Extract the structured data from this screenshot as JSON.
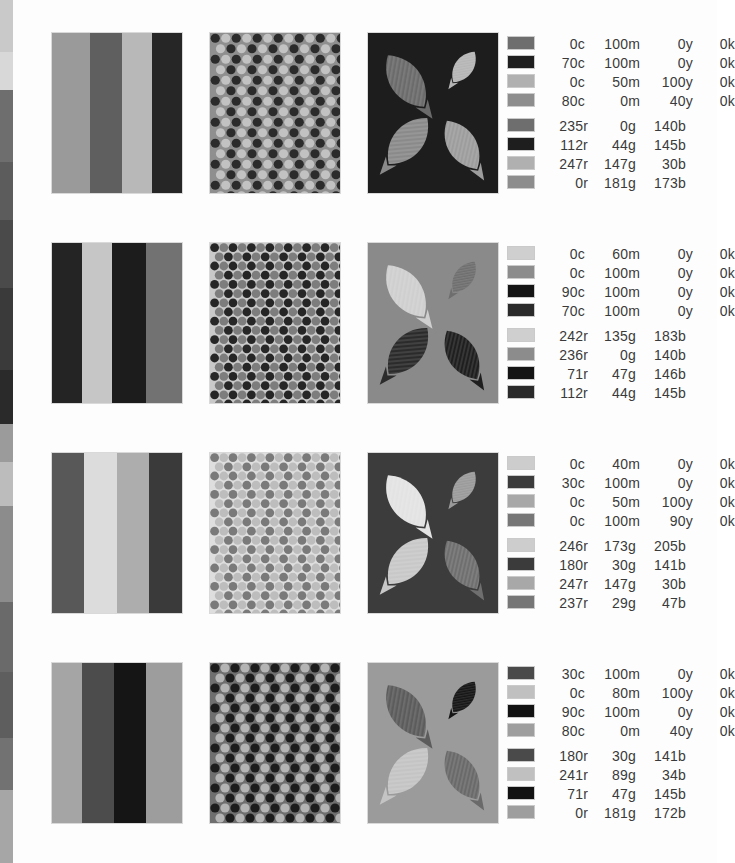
{
  "page": {
    "background": "#fdfdfd",
    "text_color": "#3a3a3a",
    "edge_sliver": {
      "name": "cut-off-adjacent-page",
      "slices": [
        {
          "top": 0,
          "height": 52,
          "color": "#c9c9c9",
          "hatched": true
        },
        {
          "top": 52,
          "height": 38,
          "color": "#d8d8d8",
          "hatched": false
        },
        {
          "top": 90,
          "height": 72,
          "color": "#6e6e6e",
          "hatched": false
        },
        {
          "top": 162,
          "height": 58,
          "color": "#5c5c5c",
          "hatched": true
        },
        {
          "top": 220,
          "height": 68,
          "color": "#4a4a4a",
          "hatched": false
        },
        {
          "top": 288,
          "height": 82,
          "color": "#3a3a3a",
          "hatched": false
        },
        {
          "top": 370,
          "height": 54,
          "color": "#2a2a2a",
          "hatched": false
        },
        {
          "top": 424,
          "height": 38,
          "color": "#9b9b9b",
          "hatched": false
        },
        {
          "top": 462,
          "height": 44,
          "color": "#bcbcbc",
          "hatched": false
        },
        {
          "top": 506,
          "height": 96,
          "color": "#8c8c8c",
          "hatched": true
        },
        {
          "top": 602,
          "height": 70,
          "color": "#6a6a6a",
          "hatched": false
        },
        {
          "top": 672,
          "height": 66,
          "color": "#5e5e5e",
          "hatched": true
        },
        {
          "top": 738,
          "height": 52,
          "color": "#727272",
          "hatched": false
        },
        {
          "top": 790,
          "height": 73,
          "color": "#a6a6a6",
          "hatched": false
        }
      ]
    }
  },
  "rows": [
    {
      "name": "swatch-row-1",
      "top": 33,
      "stripes": {
        "name": "stripe-panel",
        "bands": [
          {
            "left": 0,
            "width": 38,
            "color": "#9a9a9a",
            "hatched": false
          },
          {
            "left": 38,
            "width": 32,
            "color": "#5f5f5f",
            "hatched": true
          },
          {
            "left": 70,
            "width": 30,
            "color": "#b8b8b8",
            "hatched": false
          },
          {
            "left": 100,
            "width": 30,
            "color": "#262626",
            "hatched": false
          }
        ]
      },
      "dots": {
        "name": "halftone-dot-panel",
        "background": "#8f8f8f",
        "dot_colors": [
          "#2b2b2b",
          "#c2c2c2"
        ],
        "dot_radius": 4.6,
        "spacing": 10.5
      },
      "leaves": {
        "name": "leaf-pattern-panel",
        "background": "#1d1d1d",
        "shape_colors": [
          "#6b6b6b",
          "#b5b5b5",
          "#8a8a8a",
          "#9d9d9d"
        ]
      },
      "cmyk": [
        {
          "chip": "#6e6e6e",
          "hatched": false,
          "c": "0c",
          "m": "100m",
          "y": "0y",
          "k": "0k"
        },
        {
          "chip": "#1e1e1e",
          "hatched": false,
          "c": "70c",
          "m": "100m",
          "y": "0y",
          "k": "0k"
        },
        {
          "chip": "#b0b0b0",
          "hatched": false,
          "c": "0c",
          "m": "50m",
          "y": "100y",
          "k": "0k"
        },
        {
          "chip": "#8d8d8d",
          "hatched": false,
          "c": "80c",
          "m": "0m",
          "y": "40y",
          "k": "0k"
        }
      ],
      "rgb": [
        {
          "chip": "#6e6e6e",
          "hatched": false,
          "r": "235r",
          "g": "0g",
          "b": "140b"
        },
        {
          "chip": "#1e1e1e",
          "hatched": false,
          "r": "112r",
          "g": "44g",
          "b": "145b"
        },
        {
          "chip": "#b0b0b0",
          "hatched": false,
          "r": "247r",
          "g": "147g",
          "b": "30b"
        },
        {
          "chip": "#8d8d8d",
          "hatched": false,
          "r": "0r",
          "g": "181g",
          "b": "173b"
        }
      ]
    },
    {
      "name": "swatch-row-2",
      "top": 243,
      "stripes": {
        "name": "stripe-panel",
        "bands": [
          {
            "left": 0,
            "width": 30,
            "color": "#242424",
            "hatched": false
          },
          {
            "left": 30,
            "width": 30,
            "color": "#c6c6c6",
            "hatched": true
          },
          {
            "left": 60,
            "width": 34,
            "color": "#1c1c1c",
            "hatched": false
          },
          {
            "left": 94,
            "width": 36,
            "color": "#727272",
            "hatched": false
          }
        ]
      },
      "dots": {
        "name": "halftone-dot-panel",
        "background": "#c9c9c9",
        "dot_colors": [
          "#262626",
          "#7d7d7d"
        ],
        "dot_radius": 4.4,
        "spacing": 9.2
      },
      "leaves": {
        "name": "leaf-pattern-panel",
        "background": "#8a8a8a",
        "shape_colors": [
          "#cfcfcf",
          "#6e6e6e",
          "#2b2b2b",
          "#1f1f1f"
        ]
      },
      "cmyk": [
        {
          "chip": "#cfcfcf",
          "hatched": true,
          "c": "0c",
          "m": "60m",
          "y": "0y",
          "k": "0k"
        },
        {
          "chip": "#8c8c8c",
          "hatched": true,
          "c": "0c",
          "m": "100m",
          "y": "0y",
          "k": "0k"
        },
        {
          "chip": "#141414",
          "hatched": false,
          "c": "90c",
          "m": "100m",
          "y": "0y",
          "k": "0k"
        },
        {
          "chip": "#2a2a2a",
          "hatched": false,
          "c": "70c",
          "m": "100m",
          "y": "0y",
          "k": "0k"
        }
      ],
      "rgb": [
        {
          "chip": "#cfcfcf",
          "hatched": true,
          "r": "242r",
          "g": "135g",
          "b": "183b"
        },
        {
          "chip": "#8c8c8c",
          "hatched": false,
          "r": "236r",
          "g": "0g",
          "b": "140b"
        },
        {
          "chip": "#141414",
          "hatched": false,
          "r": "71r",
          "g": "47g",
          "b": "146b"
        },
        {
          "chip": "#2a2a2a",
          "hatched": false,
          "r": "112r",
          "g": "44g",
          "b": "145b"
        }
      ]
    },
    {
      "name": "swatch-row-3",
      "top": 453,
      "stripes": {
        "name": "stripe-panel",
        "bands": [
          {
            "left": 0,
            "width": 32,
            "color": "#585858",
            "hatched": false
          },
          {
            "left": 32,
            "width": 33,
            "color": "#dcdcdc",
            "hatched": true
          },
          {
            "left": 65,
            "width": 32,
            "color": "#adadad",
            "hatched": false
          },
          {
            "left": 97,
            "width": 33,
            "color": "#3a3a3a",
            "hatched": false
          }
        ]
      },
      "dots": {
        "name": "halftone-dot-panel",
        "background": "#dedede",
        "dot_colors": [
          "#7a7a7a",
          "#bdbdbd"
        ],
        "dot_radius": 4.4,
        "spacing": 9.2
      },
      "leaves": {
        "name": "leaf-pattern-panel",
        "background": "#3c3c3c",
        "shape_colors": [
          "#e3e3e3",
          "#9a9a9a",
          "#c8c8c8",
          "#6f6f6f"
        ]
      },
      "cmyk": [
        {
          "chip": "#cdcdcd",
          "hatched": false,
          "c": "0c",
          "m": "40m",
          "y": "0y",
          "k": "0k"
        },
        {
          "chip": "#3b3b3b",
          "hatched": false,
          "c": "30c",
          "m": "100m",
          "y": "0y",
          "k": "0k"
        },
        {
          "chip": "#a8a8a8",
          "hatched": true,
          "c": "0c",
          "m": "50m",
          "y": "100y",
          "k": "0k"
        },
        {
          "chip": "#767676",
          "hatched": false,
          "c": "0c",
          "m": "100m",
          "y": "90y",
          "k": "0k"
        }
      ],
      "rgb": [
        {
          "chip": "#cdcdcd",
          "hatched": false,
          "r": "246r",
          "g": "173g",
          "b": "205b"
        },
        {
          "chip": "#3b3b3b",
          "hatched": false,
          "r": "180r",
          "g": "30g",
          "b": "141b"
        },
        {
          "chip": "#a8a8a8",
          "hatched": true,
          "r": "247r",
          "g": "147g",
          "b": "30b"
        },
        {
          "chip": "#767676",
          "hatched": false,
          "r": "237r",
          "g": "29g",
          "b": "47b"
        }
      ]
    },
    {
      "name": "swatch-row-4",
      "top": 663,
      "stripes": {
        "name": "stripe-panel",
        "bands": [
          {
            "left": 0,
            "width": 30,
            "color": "#a5a5a5",
            "hatched": false
          },
          {
            "left": 30,
            "width": 32,
            "color": "#4c4c4c",
            "hatched": false
          },
          {
            "left": 62,
            "width": 32,
            "color": "#151515",
            "hatched": false
          },
          {
            "left": 94,
            "width": 36,
            "color": "#9d9d9d",
            "hatched": true
          }
        ]
      },
      "dots": {
        "name": "halftone-dot-panel",
        "background": "#6f6f6f",
        "dot_colors": [
          "#1c1c1c",
          "#b4b4b4"
        ],
        "dot_radius": 4.6,
        "spacing": 10.0
      },
      "leaves": {
        "name": "leaf-pattern-panel",
        "background": "#9b9b9b",
        "shape_colors": [
          "#5c5c5c",
          "#151515",
          "#c4c4c4",
          "#6a6a6a"
        ]
      },
      "cmyk": [
        {
          "chip": "#4a4a4a",
          "hatched": false,
          "c": "30c",
          "m": "100m",
          "y": "0y",
          "k": "0k"
        },
        {
          "chip": "#c0c0c0",
          "hatched": true,
          "c": "0c",
          "m": "80m",
          "y": "100y",
          "k": "0k"
        },
        {
          "chip": "#121212",
          "hatched": false,
          "c": "90c",
          "m": "100m",
          "y": "0y",
          "k": "0k"
        },
        {
          "chip": "#9e9e9e",
          "hatched": false,
          "c": "80c",
          "m": "0m",
          "y": "40y",
          "k": "0k"
        }
      ],
      "rgb": [
        {
          "chip": "#4a4a4a",
          "hatched": true,
          "r": "180r",
          "g": "30g",
          "b": "141b"
        },
        {
          "chip": "#c0c0c0",
          "hatched": true,
          "r": "241r",
          "g": "89g",
          "b": "34b"
        },
        {
          "chip": "#121212",
          "hatched": false,
          "r": "71r",
          "g": "47g",
          "b": "145b"
        },
        {
          "chip": "#9e9e9e",
          "hatched": false,
          "r": "0r",
          "g": "181g",
          "b": "172b"
        }
      ]
    }
  ]
}
